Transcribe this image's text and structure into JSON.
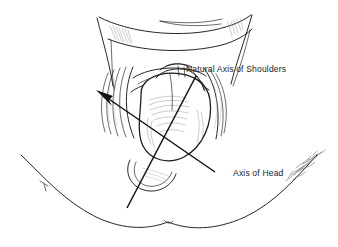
{
  "figure": {
    "kind": "medical-illustration",
    "background_color": "#ffffff",
    "ink_color": "#1a1a1a",
    "shading_color": "#8e8e92",
    "width": 338,
    "height": 247
  },
  "labels": {
    "shoulders_axis": "Natural Axis of Shoulders",
    "head_axis": "Axis of Head"
  },
  "annotations": [
    {
      "id": "shoulders",
      "text": "Natural Axis of Shoulders",
      "text_x": 186,
      "text_y": 72,
      "line_from": [
        196,
        76
      ],
      "line_to": [
        127,
        208
      ],
      "has_arrowhead": false
    },
    {
      "id": "head",
      "text": "Axis of Head",
      "text_x": 233,
      "text_y": 173,
      "line_from": [
        215,
        172
      ],
      "line_to": [
        98,
        92
      ],
      "has_arrowhead": true,
      "arrow_at": [
        98,
        92
      ]
    }
  ],
  "signature": {
    "legible": false,
    "description": "cursive artist signature",
    "x": 292,
    "y": 170
  }
}
